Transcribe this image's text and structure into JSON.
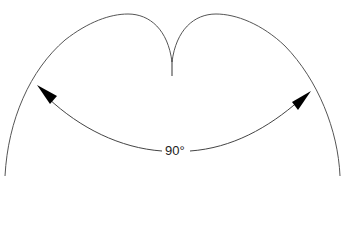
{
  "diagram": {
    "type": "polar-radiation-pattern",
    "angle_label": "90°",
    "colors": {
      "outline": "#555555",
      "arrow": "#000000",
      "background": "#ffffff"
    }
  }
}
